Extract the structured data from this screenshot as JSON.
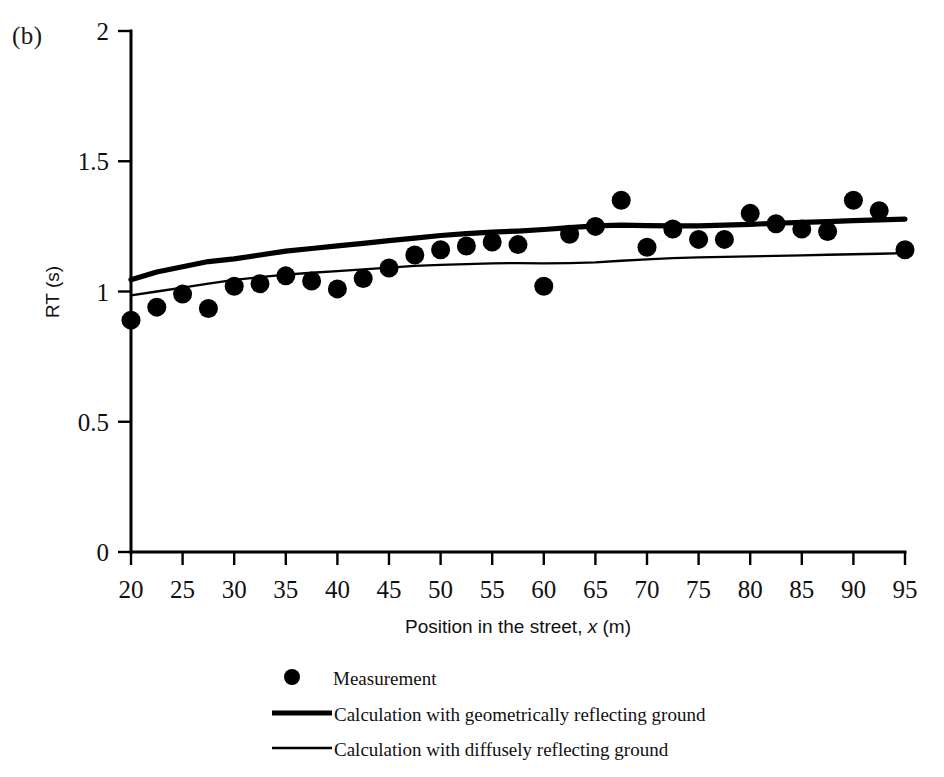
{
  "figure": {
    "panel_label": "(b)",
    "background_color": "#ffffff",
    "ink_color": "#000000"
  },
  "chart_data": {
    "type": "scatter",
    "title": "",
    "panel": "(b)",
    "xlabel_prefix": "Position in the street, ",
    "xlabel_variable": "x",
    "xlabel_suffix": " (m)",
    "xlabel": "Position in the street, x (m)",
    "ylabel": "RT (s)",
    "xlim": [
      20,
      95
    ],
    "ylim": [
      0,
      2
    ],
    "xticks": [
      20,
      25,
      30,
      35,
      40,
      45,
      50,
      55,
      60,
      65,
      70,
      75,
      80,
      85,
      90,
      95
    ],
    "xtick_labels": [
      "20",
      "25",
      "30",
      "35",
      "40",
      "45",
      "50",
      "55",
      "60",
      "65",
      "70",
      "75",
      "80",
      "85",
      "90",
      "95"
    ],
    "yticks": [
      0,
      0.5,
      1,
      1.5,
      2
    ],
    "ytick_labels": [
      "0",
      "0.5",
      "1",
      "1.5",
      "2"
    ],
    "grid": false,
    "legend_position": "below-axes",
    "series": [
      {
        "name": "Measurement",
        "type": "scatter",
        "marker": "filled-circle",
        "color": "#000000",
        "points": [
          [
            20.0,
            0.89
          ],
          [
            22.5,
            0.94
          ],
          [
            25.0,
            0.99
          ],
          [
            27.5,
            0.935
          ],
          [
            30.0,
            1.02
          ],
          [
            32.5,
            1.03
          ],
          [
            35.0,
            1.06
          ],
          [
            37.5,
            1.04
          ],
          [
            40.0,
            1.01
          ],
          [
            42.5,
            1.05
          ],
          [
            45.0,
            1.09
          ],
          [
            47.5,
            1.14
          ],
          [
            50.0,
            1.16
          ],
          [
            52.5,
            1.175
          ],
          [
            55.0,
            1.19
          ],
          [
            57.5,
            1.18
          ],
          [
            60.0,
            1.02
          ],
          [
            62.5,
            1.22
          ],
          [
            65.0,
            1.25
          ],
          [
            67.5,
            1.35
          ],
          [
            70.0,
            1.17
          ],
          [
            72.5,
            1.24
          ],
          [
            75.0,
            1.2
          ],
          [
            77.5,
            1.2
          ],
          [
            80.0,
            1.3
          ],
          [
            82.5,
            1.26
          ],
          [
            85.0,
            1.24
          ],
          [
            87.5,
            1.23
          ],
          [
            90.0,
            1.35
          ],
          [
            92.5,
            1.31
          ],
          [
            95.0,
            1.16
          ]
        ]
      },
      {
        "name": "Calculation with geometrically reflecting ground",
        "type": "line",
        "line_width": "thick",
        "color": "#000000",
        "points": [
          [
            20.0,
            1.045
          ],
          [
            22.5,
            1.075
          ],
          [
            25.0,
            1.095
          ],
          [
            27.5,
            1.115
          ],
          [
            30.0,
            1.125
          ],
          [
            32.5,
            1.14
          ],
          [
            35.0,
            1.155
          ],
          [
            37.5,
            1.165
          ],
          [
            40.0,
            1.175
          ],
          [
            42.5,
            1.185
          ],
          [
            45.0,
            1.195
          ],
          [
            47.5,
            1.205
          ],
          [
            50.0,
            1.215
          ],
          [
            52.5,
            1.222
          ],
          [
            55.0,
            1.228
          ],
          [
            57.5,
            1.232
          ],
          [
            60.0,
            1.238
          ],
          [
            62.5,
            1.245
          ],
          [
            65.0,
            1.252
          ],
          [
            67.5,
            1.255
          ],
          [
            70.0,
            1.253
          ],
          [
            72.5,
            1.252
          ],
          [
            75.0,
            1.252
          ],
          [
            77.5,
            1.255
          ],
          [
            80.0,
            1.258
          ],
          [
            82.5,
            1.262
          ],
          [
            85.0,
            1.265
          ],
          [
            87.5,
            1.268
          ],
          [
            90.0,
            1.272
          ],
          [
            92.5,
            1.275
          ],
          [
            95.0,
            1.278
          ]
        ]
      },
      {
        "name": "Calculation with diffusely reflecting ground",
        "type": "line",
        "line_width": "thin",
        "color": "#000000",
        "points": [
          [
            20.0,
            0.985
          ],
          [
            22.5,
            1.0
          ],
          [
            25.0,
            1.015
          ],
          [
            27.5,
            1.03
          ],
          [
            30.0,
            1.045
          ],
          [
            32.5,
            1.055
          ],
          [
            35.0,
            1.065
          ],
          [
            37.5,
            1.072
          ],
          [
            40.0,
            1.078
          ],
          [
            42.5,
            1.085
          ],
          [
            45.0,
            1.092
          ],
          [
            47.5,
            1.098
          ],
          [
            50.0,
            1.102
          ],
          [
            52.5,
            1.105
          ],
          [
            55.0,
            1.108
          ],
          [
            57.5,
            1.109
          ],
          [
            60.0,
            1.108
          ],
          [
            62.5,
            1.109
          ],
          [
            65.0,
            1.112
          ],
          [
            67.5,
            1.118
          ],
          [
            70.0,
            1.123
          ],
          [
            72.5,
            1.128
          ],
          [
            75.0,
            1.131
          ],
          [
            77.5,
            1.133
          ],
          [
            80.0,
            1.135
          ],
          [
            82.5,
            1.137
          ],
          [
            85.0,
            1.139
          ],
          [
            87.5,
            1.141
          ],
          [
            90.0,
            1.143
          ],
          [
            92.5,
            1.145
          ],
          [
            95.0,
            1.147
          ]
        ]
      }
    ],
    "legend": [
      {
        "label": "Measurement",
        "marker": "filled-circle"
      },
      {
        "label": "Calculation with geometrically reflecting ground",
        "marker": "thick-line"
      },
      {
        "label": "Calculation with diffusely reflecting ground",
        "marker": "thin-line"
      }
    ]
  }
}
